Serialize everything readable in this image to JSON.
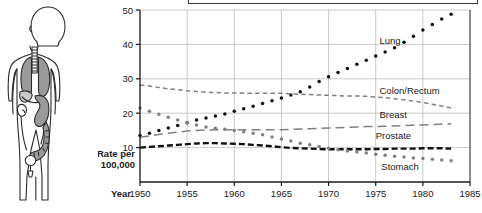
{
  "figure": {
    "illustration_name": "human-body-organs-diagram",
    "organs": [
      "lungs",
      "trachea",
      "stomach",
      "kidney",
      "colon",
      "bladder",
      "liver"
    ]
  },
  "caption_box": {
    "text": ""
  },
  "axes": {
    "ylabel_line1": "Rate per",
    "ylabel_line2": "100,000",
    "xlabel": "Year",
    "yticks": [
      "10",
      "20",
      "30",
      "40",
      "50"
    ],
    "xticks": [
      "1950",
      "1955",
      "1960",
      "1965",
      "1970",
      "1975",
      "1980",
      "1985"
    ]
  },
  "chart_data": {
    "type": "line",
    "title": "",
    "xlabel": "Year",
    "ylabel": "Rate per 100,000",
    "xlim": [
      1950,
      1985
    ],
    "ylim": [
      0,
      50
    ],
    "yticks": [
      10,
      20,
      30,
      40,
      50
    ],
    "xticks": [
      1950,
      1955,
      1960,
      1965,
      1970,
      1975,
      1980,
      1985
    ],
    "grid": true,
    "legend_position": "inline-right",
    "x": [
      1950,
      1951,
      1952,
      1953,
      1954,
      1955,
      1956,
      1957,
      1958,
      1959,
      1960,
      1961,
      1962,
      1963,
      1964,
      1965,
      1966,
      1967,
      1968,
      1969,
      1970,
      1971,
      1972,
      1973,
      1974,
      1975,
      1976,
      1977,
      1978,
      1979,
      1980,
      1981,
      1982,
      1983
    ],
    "series": [
      {
        "name": "Lung",
        "style": "dotted",
        "color": "#111111",
        "label": "Lung",
        "values": [
          13.5,
          14.2,
          15.0,
          15.7,
          16.4,
          17.2,
          18.0,
          18.6,
          19.2,
          19.8,
          20.6,
          21.3,
          22.0,
          22.8,
          23.6,
          24.4,
          25.3,
          26.2,
          27.6,
          29.2,
          30.6,
          31.8,
          33.0,
          34.2,
          35.4,
          36.6,
          37.8,
          39.0,
          40.6,
          42.4,
          44.2,
          45.8,
          47.4,
          48.8
        ]
      },
      {
        "name": "Colon/Rectum",
        "style": "short-dash",
        "color": "#808080",
        "label": "Colon/Rectum",
        "values": [
          28.2,
          27.9,
          27.5,
          27.1,
          26.8,
          26.5,
          26.3,
          26.1,
          26.0,
          25.9,
          25.9,
          25.8,
          25.8,
          25.8,
          25.8,
          25.8,
          25.6,
          25.5,
          25.4,
          25.3,
          25.2,
          25.1,
          25.0,
          25.0,
          24.9,
          24.7,
          24.5,
          24.2,
          23.9,
          23.5,
          23.1,
          22.6,
          22.1,
          21.5
        ]
      },
      {
        "name": "Breast",
        "style": "long-dash",
        "color": "#808080",
        "label": "Breast",
        "values": [
          13.0,
          13.4,
          13.8,
          14.2,
          14.5,
          14.8,
          15.0,
          15.1,
          15.2,
          15.2,
          15.2,
          15.2,
          15.2,
          15.2,
          15.2,
          15.2,
          15.3,
          15.4,
          15.5,
          15.6,
          15.7,
          15.8,
          15.9,
          16.0,
          16.1,
          16.1,
          16.2,
          16.3,
          16.4,
          16.5,
          16.6,
          16.7,
          16.8,
          16.9
        ]
      },
      {
        "name": "Prostate",
        "style": "heavy-dash",
        "color": "#111111",
        "label": "Prostate",
        "values": [
          10.0,
          10.2,
          10.4,
          10.6,
          10.8,
          11.0,
          11.2,
          11.3,
          11.3,
          11.2,
          11.1,
          11.0,
          10.8,
          10.6,
          10.4,
          10.1,
          9.9,
          9.8,
          9.7,
          9.6,
          9.5,
          9.5,
          9.5,
          9.5,
          9.5,
          9.6,
          9.6,
          9.7,
          9.7,
          9.7,
          9.8,
          9.8,
          9.8,
          9.7
        ]
      },
      {
        "name": "Stomach",
        "style": "dotted",
        "color": "#808080",
        "label": "Stomach",
        "values": [
          21.5,
          20.6,
          19.7,
          18.8,
          18.0,
          17.2,
          16.6,
          16.0,
          15.6,
          15.3,
          15.0,
          14.6,
          14.2,
          13.7,
          13.1,
          12.5,
          11.9,
          11.3,
          10.8,
          10.3,
          9.8,
          9.4,
          9.0,
          8.7,
          8.4,
          8.1,
          7.8,
          7.5,
          7.3,
          7.0,
          6.8,
          6.6,
          6.4,
          6.2
        ]
      }
    ]
  }
}
